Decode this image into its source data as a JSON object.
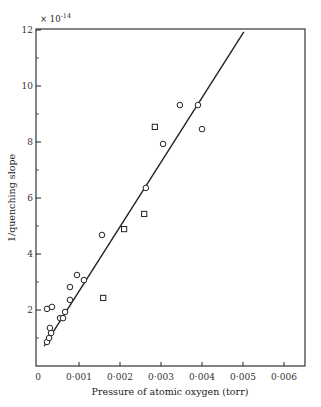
{
  "chart_data": {
    "type": "scatter",
    "title": "",
    "xlabel": "Pressure of atomic oxygen (torr)",
    "ylabel": "1/quenching slope",
    "y_multiplier": "× 10⁻¹⁴",
    "xlim": [
      0,
      0.0065
    ],
    "ylim": [
      0,
      12
    ],
    "x_ticks": [
      0,
      0.001,
      0.002,
      0.003,
      0.004,
      0.005,
      0.006
    ],
    "x_tick_labels": [
      "0",
      "0·001",
      "0·002",
      "0·003",
      "0·004",
      "0·005",
      "0·006"
    ],
    "y_ticks": [
      2,
      4,
      6,
      8,
      10,
      12
    ],
    "y_tick_labels": [
      "2",
      "4",
      "6",
      "8",
      "10",
      "12"
    ],
    "y_minor_ticks": [
      1,
      3,
      5,
      7,
      9,
      11
    ],
    "grid": false,
    "legend": null,
    "series": [
      {
        "name": "circles",
        "marker": "circle",
        "points": [
          [
            0.00022,
            0.86
          ],
          [
            0.00027,
            1.0
          ],
          [
            0.00032,
            1.18
          ],
          [
            0.00029,
            1.36
          ],
          [
            0.00022,
            2.04
          ],
          [
            0.00034,
            2.11
          ],
          [
            0.00054,
            1.71
          ],
          [
            0.00061,
            1.71
          ],
          [
            0.00066,
            1.93
          ],
          [
            0.00078,
            2.36
          ],
          [
            0.00078,
            2.82
          ],
          [
            0.00095,
            3.25
          ],
          [
            0.00112,
            3.07
          ],
          [
            0.00156,
            4.68
          ],
          [
            0.00263,
            6.36
          ],
          [
            0.00305,
            7.93
          ],
          [
            0.00346,
            9.32
          ],
          [
            0.0039,
            9.32
          ],
          [
            0.004,
            8.46
          ]
        ]
      },
      {
        "name": "squares",
        "marker": "square",
        "points": [
          [
            0.00159,
            2.43
          ],
          [
            0.0021,
            4.89
          ],
          [
            0.00259,
            5.43
          ],
          [
            0.00285,
            8.54
          ]
        ]
      }
    ],
    "fit_line": {
      "type": "linear",
      "from": [
        0.00015,
        0.71
      ],
      "to": [
        0.00502,
        11.93
      ]
    }
  },
  "labels": {
    "xlabel": "Pressure of atomic oxygen (torr)",
    "ylabel": "1/quenching slope",
    "multiplier": "× 10",
    "multiplier_exp": "-14"
  },
  "colors": {
    "ink": "#222222",
    "background": "#ffffff"
  }
}
